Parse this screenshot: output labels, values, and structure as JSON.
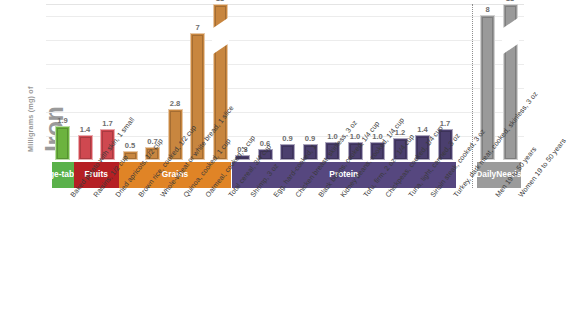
{
  "axis": {
    "y_label_small": "Milligrams (mg) of",
    "y_label_big": "Iron"
  },
  "bands": [
    {
      "name": "vegetables",
      "label": "Vege-\ntables",
      "color": "#5ab14a"
    },
    {
      "name": "fruits",
      "label": "Fruits",
      "color": "#b51f23"
    },
    {
      "name": "grains",
      "label": "Grains",
      "color": "#e08426"
    },
    {
      "name": "protein",
      "label": "Protein",
      "color": "#56477f"
    },
    {
      "name": "daily-needs",
      "label": "Daily\nNeeds",
      "color": "#9b9b9b"
    }
  ],
  "chart_data": {
    "type": "bar",
    "xlabel": "",
    "ylabel": "Milligrams (mg) of Iron",
    "ylim": [
      0,
      8.6
    ],
    "grid": true,
    "legend_position": "none",
    "axis_break": true,
    "axis_break_note": "Bars valued 18 are truncated with a diagonal break",
    "categories": [
      "Baked potato with skin, 1 small",
      "Raisins, 1/2 cup",
      "Dried apricots, 1/2 cup",
      "Brown rice, cooked, 1/2 cup",
      "Whole-wheat or white bread, 1 slice",
      "Quinoa, cooked, 1 cup",
      "Oatmeal, cooked, 1 cup",
      "Total cereal, 3/4 cup",
      "Shrimp, 3 oz",
      "Egg, hard-cooked, 1",
      "Chicken breast, skinless, 3 oz",
      "Black beans, cooked, 1/4 cup",
      "Kidney beans, cooked, 1/4 cup",
      "Tofu, firm, 2 oz - 1/4 cup",
      "Chickpeas, cooked, 1/4 cup",
      "Tuna, light, canned, 3 oz",
      "Sirloin steak, cooked, 3 oz",
      "Turkey, dark meat, cooked, skinless, 3 oz",
      "Men 19 to 50 years",
      "Women 19 to 50 years"
    ],
    "values": [
      1.9,
      1.4,
      1.7,
      0.5,
      0.7,
      2.8,
      7,
      18,
      0.3,
      0.6,
      0.9,
      0.9,
      1.0,
      1.0,
      1.0,
      1.2,
      1.4,
      1.7,
      8,
      18
    ],
    "value_labels": [
      "1.9",
      "1.4",
      "1.7",
      "0.5",
      "0.7",
      "2.8",
      "7",
      "18",
      "0.3",
      "0.6",
      "0.9",
      "0.9",
      "1.0",
      "1.0",
      "1.0",
      "1.2",
      "1.4",
      "1.7",
      "8",
      "18"
    ],
    "groups": [
      "Vegetables",
      "Fruits",
      "Fruits",
      "Grains",
      "Grains",
      "Grains",
      "Grains",
      "Grains",
      "Protein",
      "Protein",
      "Protein",
      "Protein",
      "Protein",
      "Protein",
      "Protein",
      "Protein",
      "Protein",
      "Protein",
      "Daily Needs",
      "Daily Needs"
    ],
    "bar_colors": [
      "#6cb33f",
      "#cf4850",
      "#cf4850",
      "#c8863f",
      "#c8863f",
      "#c8863f",
      "#c8863f",
      "#c8863f",
      "#4b3f6e",
      "#4b3f6e",
      "#4b3f6e",
      "#4b3f6e",
      "#4b3f6e",
      "#4b3f6e",
      "#4b3f6e",
      "#4b3f6e",
      "#4b3f6e",
      "#4b3f6e",
      "#9a9a9a",
      "#9a9a9a"
    ]
  }
}
